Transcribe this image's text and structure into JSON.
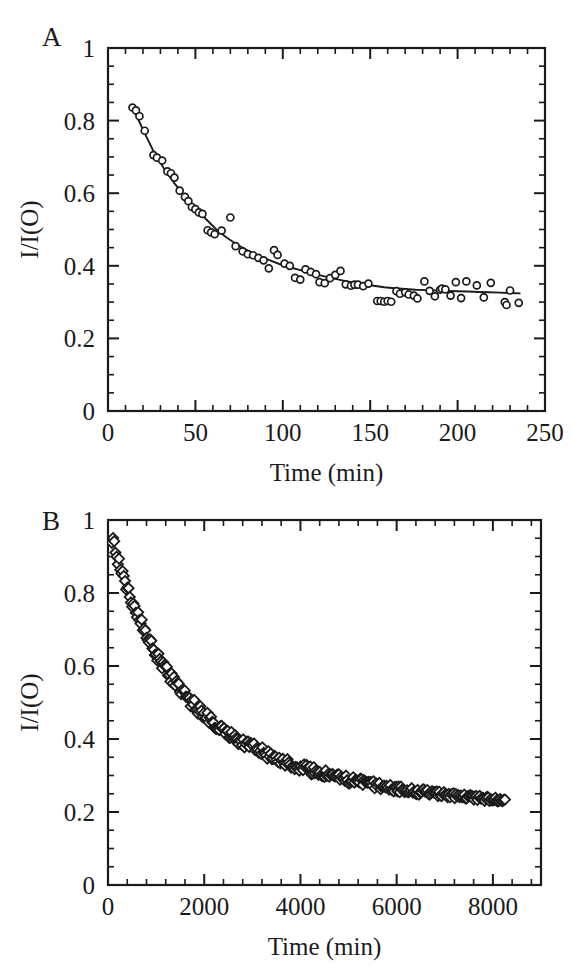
{
  "figure": {
    "background_color": "#ffffff",
    "ink_color": "#1a1a1a",
    "width": 586,
    "height": 978
  },
  "panels": [
    {
      "letter": "A",
      "name": "panel-a"
    },
    {
      "letter": "B",
      "name": "panel-b"
    }
  ],
  "chart_data": [
    {
      "type": "scatter",
      "panel": "A",
      "title": "",
      "xlabel": "Time (min)",
      "ylabel": "I/I(O)",
      "xlim": [
        0,
        250
      ],
      "ylim": [
        0,
        1
      ],
      "xticks": [
        0,
        50,
        100,
        150,
        200,
        250
      ],
      "xticklabels": [
        "0",
        "50",
        "100",
        "150",
        "200",
        "250"
      ],
      "yticks": [
        0,
        0.2,
        0.4,
        0.6,
        0.8,
        1
      ],
      "yticklabels": [
        "0",
        "0.2",
        "0.4",
        "0.6",
        "0.8",
        "1"
      ],
      "x_minor_interval": 10,
      "y_minor_interval": 0.05,
      "grid": false,
      "legend": false,
      "marker": "open-circle",
      "marker_size": 7,
      "frame": "box",
      "tick_direction": "in",
      "series": [
        {
          "name": "I/I(O) decay",
          "marker": "open-circle",
          "points": [
            [
              14.0,
              0.836
            ],
            [
              16.0,
              0.828
            ],
            [
              18.0,
              0.812
            ],
            [
              21.0,
              0.772
            ],
            [
              26.0,
              0.705
            ],
            [
              28.0,
              0.698
            ],
            [
              31.0,
              0.69
            ],
            [
              34.0,
              0.66
            ],
            [
              36.0,
              0.655
            ],
            [
              38.0,
              0.643
            ],
            [
              41.0,
              0.607
            ],
            [
              44.0,
              0.59
            ],
            [
              46.0,
              0.578
            ],
            [
              48.0,
              0.562
            ],
            [
              50.0,
              0.556
            ],
            [
              52.0,
              0.547
            ],
            [
              54.0,
              0.543
            ],
            [
              57.0,
              0.498
            ],
            [
              59.0,
              0.492
            ],
            [
              61.0,
              0.487
            ],
            [
              65.0,
              0.497
            ],
            [
              70.0,
              0.533
            ],
            [
              73.0,
              0.454
            ],
            [
              77.0,
              0.44
            ],
            [
              80.0,
              0.432
            ],
            [
              83.0,
              0.429
            ],
            [
              86.0,
              0.422
            ],
            [
              89.0,
              0.415
            ],
            [
              92.0,
              0.393
            ],
            [
              95.0,
              0.443
            ],
            [
              97.0,
              0.43
            ],
            [
              101.0,
              0.406
            ],
            [
              104.0,
              0.4
            ],
            [
              107.0,
              0.367
            ],
            [
              110.0,
              0.362
            ],
            [
              113.0,
              0.39
            ],
            [
              116.0,
              0.383
            ],
            [
              119.0,
              0.377
            ],
            [
              121.0,
              0.355
            ],
            [
              124.0,
              0.352
            ],
            [
              127.0,
              0.366
            ],
            [
              130.0,
              0.375
            ],
            [
              133.0,
              0.386
            ],
            [
              136.0,
              0.349
            ],
            [
              139.0,
              0.345
            ],
            [
              141.0,
              0.348
            ],
            [
              143.0,
              0.348
            ],
            [
              146.0,
              0.344
            ],
            [
              149.0,
              0.351
            ],
            [
              154.0,
              0.303
            ],
            [
              156.0,
              0.303
            ],
            [
              158.0,
              0.301
            ],
            [
              160.0,
              0.303
            ],
            [
              162.0,
              0.301
            ],
            [
              165.0,
              0.33
            ],
            [
              167.0,
              0.323
            ],
            [
              170.0,
              0.327
            ],
            [
              172.0,
              0.321
            ],
            [
              175.0,
              0.318
            ],
            [
              177.0,
              0.31
            ],
            [
              181.0,
              0.357
            ],
            [
              184.0,
              0.331
            ],
            [
              187.0,
              0.316
            ],
            [
              190.0,
              0.334
            ],
            [
              191.0,
              0.337
            ],
            [
              193.0,
              0.335
            ],
            [
              196.0,
              0.318
            ],
            [
              199.0,
              0.355
            ],
            [
              202.0,
              0.311
            ],
            [
              205.0,
              0.357
            ],
            [
              211.0,
              0.346
            ],
            [
              215.0,
              0.313
            ],
            [
              219.0,
              0.353
            ],
            [
              227.0,
              0.3
            ],
            [
              228.0,
              0.292
            ],
            [
              230.0,
              0.332
            ],
            [
              235.0,
              0.298
            ]
          ]
        }
      ],
      "fit_line": {
        "name": "biexponential fit",
        "points": [
          [
            14.0,
            0.838
          ],
          [
            20.0,
            0.775
          ],
          [
            26.0,
            0.716
          ],
          [
            32.0,
            0.668
          ],
          [
            38.0,
            0.627
          ],
          [
            44.0,
            0.592
          ],
          [
            50.0,
            0.56
          ],
          [
            56.0,
            0.529
          ],
          [
            62.0,
            0.5
          ],
          [
            68.0,
            0.477
          ],
          [
            74.0,
            0.458
          ],
          [
            80.0,
            0.442
          ],
          [
            86.0,
            0.428
          ],
          [
            92.0,
            0.416
          ],
          [
            98.0,
            0.405
          ],
          [
            104.0,
            0.396
          ],
          [
            110.0,
            0.388
          ],
          [
            116.0,
            0.38
          ],
          [
            122.0,
            0.373
          ],
          [
            128.0,
            0.366
          ],
          [
            134.0,
            0.36
          ],
          [
            140.0,
            0.354
          ],
          [
            146.0,
            0.349
          ],
          [
            152.0,
            0.345
          ],
          [
            158.0,
            0.341
          ],
          [
            164.0,
            0.338
          ],
          [
            170.0,
            0.336
          ],
          [
            176.0,
            0.334
          ],
          [
            182.0,
            0.333
          ],
          [
            188.0,
            0.332
          ],
          [
            194.0,
            0.331
          ],
          [
            200.0,
            0.33
          ],
          [
            206.0,
            0.329
          ],
          [
            212.0,
            0.328
          ],
          [
            218.0,
            0.327
          ],
          [
            224.0,
            0.326
          ],
          [
            230.0,
            0.325
          ],
          [
            236.0,
            0.324
          ]
        ]
      }
    },
    {
      "type": "scatter",
      "panel": "B",
      "title": "",
      "xlabel": "Time (min)",
      "ylabel": "I/I(O)",
      "xlim": [
        0,
        9000
      ],
      "ylim": [
        0,
        1
      ],
      "xticks": [
        0,
        2000,
        4000,
        6000,
        8000
      ],
      "xticklabels": [
        "0",
        "2000",
        "4000",
        "6000",
        "8000"
      ],
      "yticks": [
        0,
        0.2,
        0.4,
        0.6,
        0.8,
        1
      ],
      "yticklabels": [
        "0",
        "0.2",
        "0.4",
        "0.6",
        "0.8",
        "1"
      ],
      "x_minor_interval": 400,
      "y_minor_interval": 0.05,
      "grid": false,
      "legend": false,
      "marker": "open-diamond",
      "marker_size": 8,
      "frame": "box",
      "tick_direction": "in",
      "series": [
        {
          "name": "I/I(O) decay",
          "marker": "open-diamond",
          "decay_model": {
            "description": "dense sampled decay, 0.995 -> 0.22 over 0-8200 min",
            "amplitude": 0.79,
            "offset": 0.205,
            "tau_fast": 900,
            "tau_slow": 3000,
            "fast_fraction": 0.45,
            "t_start": 80,
            "t_end": 8250,
            "n_points": 330,
            "noise_amplitude": 0.012
          }
        }
      ]
    }
  ]
}
